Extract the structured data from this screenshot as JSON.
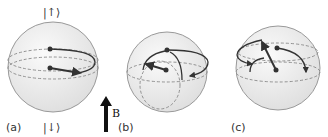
{
  "figure": {
    "panels": [
      {
        "id": "a",
        "label": "(a)",
        "top_state": "|↑⟩",
        "bottom_state": "|↓⟩"
      },
      {
        "id": "b",
        "label": "(b)"
      },
      {
        "id": "c",
        "label": "(c)"
      }
    ],
    "field": {
      "label": "B",
      "direction": "up"
    },
    "colors": {
      "sphere_fill": "#ececec",
      "sphere_edge": "#999999",
      "line": "#333333",
      "dash": "#777777"
    }
  }
}
